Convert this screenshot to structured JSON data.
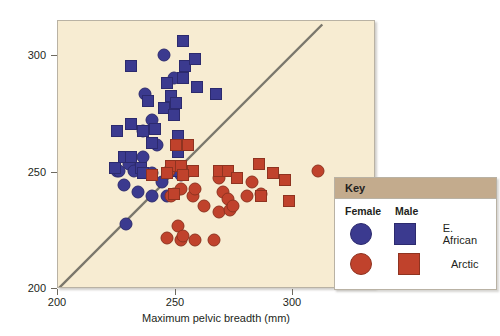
{
  "chart_data": {
    "type": "scatter",
    "title": "",
    "xlabel": "Maximum pelvic breadth (mm)",
    "ylabel": "Maximum ulnar length (mm)",
    "xlim": [
      200,
      335
    ],
    "ylim": [
      200,
      315
    ],
    "xticks": [
      200,
      250,
      300
    ],
    "yticks": [
      200,
      250,
      300
    ],
    "grid": false,
    "background_color": "#f7ecd2",
    "reference_line": {
      "description": "diagonal line of equality",
      "color": "#7a776c",
      "x": [
        200,
        312
      ],
      "y": [
        200,
        314
      ]
    },
    "series": [
      {
        "name": "E. African Female",
        "marker": "circle",
        "color": "#3b3a8f",
        "points": [
          [
            245,
            301
          ],
          [
            249,
            291
          ],
          [
            237,
            284
          ],
          [
            248,
            278
          ],
          [
            240,
            273
          ],
          [
            236,
            268
          ],
          [
            242,
            262
          ],
          [
            236,
            257
          ],
          [
            230,
            254
          ],
          [
            225,
            251
          ],
          [
            226,
            251
          ],
          [
            232,
            251
          ],
          [
            228,
            245
          ],
          [
            240,
            250
          ],
          [
            244,
            246
          ],
          [
            240,
            240
          ],
          [
            229,
            228
          ],
          [
            252,
            249
          ],
          [
            246,
            240
          ],
          [
            234,
            242
          ]
        ]
      },
      {
        "name": "E. African Male",
        "marker": "square",
        "color": "#3b3a8f",
        "points": [
          [
            253,
            307
          ],
          [
            231,
            296
          ],
          [
            254,
            296
          ],
          [
            258,
            299
          ],
          [
            253,
            291
          ],
          [
            246,
            289
          ],
          [
            259,
            287
          ],
          [
            267,
            284
          ],
          [
            248,
            283
          ],
          [
            250,
            280
          ],
          [
            238,
            281
          ],
          [
            245,
            278
          ],
          [
            249,
            275
          ],
          [
            231,
            271
          ],
          [
            225,
            268
          ],
          [
            236,
            268
          ],
          [
            241,
            269
          ],
          [
            251,
            266
          ],
          [
            240,
            263
          ],
          [
            251,
            259
          ],
          [
            228,
            257
          ],
          [
            231,
            257
          ],
          [
            224,
            252
          ],
          [
            235,
            252
          ],
          [
            236,
            250
          ],
          [
            249,
            251
          ]
        ]
      },
      {
        "name": "Arctic Female",
        "marker": "circle",
        "color": "#c0422c",
        "points": [
          [
            247,
            251
          ],
          [
            249,
            241
          ],
          [
            254,
            250
          ],
          [
            252,
            243
          ],
          [
            257,
            240
          ],
          [
            258,
            243
          ],
          [
            262,
            236
          ],
          [
            268,
            248
          ],
          [
            270,
            242
          ],
          [
            272,
            239
          ],
          [
            268,
            233
          ],
          [
            273,
            234
          ],
          [
            280,
            240
          ],
          [
            282,
            246
          ],
          [
            310,
            251
          ],
          [
            251,
            227
          ],
          [
            246,
            222
          ],
          [
            252,
            221
          ],
          [
            253,
            223
          ],
          [
            258,
            221
          ],
          [
            266,
            221
          ],
          [
            248,
            240
          ],
          [
            274,
            236
          ],
          [
            286,
            241
          ]
        ]
      },
      {
        "name": "Arctic Male",
        "marker": "square",
        "color": "#c0422c",
        "points": [
          [
            250,
            262
          ],
          [
            255,
            262
          ],
          [
            248,
            253
          ],
          [
            252,
            253
          ],
          [
            257,
            251
          ],
          [
            249,
            241
          ],
          [
            268,
            251
          ],
          [
            272,
            251
          ],
          [
            276,
            248
          ],
          [
            285,
            254
          ],
          [
            291,
            250
          ],
          [
            296,
            247
          ],
          [
            286,
            240
          ],
          [
            298,
            238
          ],
          [
            246,
            250
          ],
          [
            253,
            249
          ],
          [
            240,
            249
          ]
        ]
      }
    ]
  },
  "axes": {
    "y_title": "Maximum ulnar length (mm)",
    "x_title": "Maximum pelvic breadth (mm)",
    "y_tick_labels": [
      "300",
      "250",
      "200"
    ],
    "x_tick_labels": [
      "200",
      "250",
      "300"
    ]
  },
  "legend": {
    "title": "Key",
    "col_female": "Female",
    "col_male": "Male",
    "rows": [
      {
        "label": "E. African",
        "circle_color": "#3b3a8f",
        "square_color": "#3b3a8f"
      },
      {
        "label": "Arctic",
        "circle_color": "#c0422c",
        "square_color": "#c0422c"
      }
    ]
  }
}
